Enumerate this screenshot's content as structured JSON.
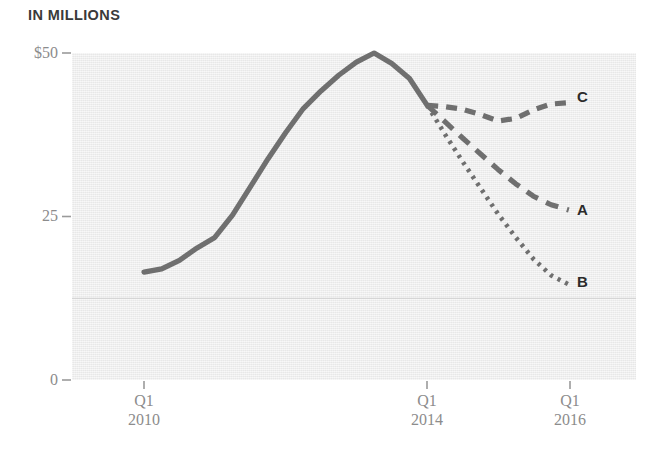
{
  "chart_data": {
    "type": "line",
    "title": "IN MILLIONS",
    "xlabel": "",
    "ylabel": "",
    "ylim": [
      0,
      50
    ],
    "yticks": [
      0,
      25,
      50
    ],
    "ytick_labels": [
      "0",
      "25",
      "$50"
    ],
    "xtick_labels": [
      {
        "quarter": "Q1",
        "year": "2010"
      },
      {
        "quarter": "Q1",
        "year": "2014"
      },
      {
        "quarter": "Q1",
        "year": "2016"
      }
    ],
    "grid": "single faint horizontal rule at 12.5",
    "gridline_values": [
      12.5
    ],
    "legend_position": "inline-right-of-line-ends",
    "line_color": "#6e6e6e",
    "plot_background": "#ececec",
    "series": [
      {
        "name": "history",
        "label": "",
        "style": "solid",
        "x": [
          "Q1 2010",
          "Q2 2010",
          "Q3 2010",
          "Q4 2010",
          "Q1 2011",
          "Q2 2011",
          "Q3 2011",
          "Q4 2011",
          "Q1 2012",
          "Q2 2012",
          "Q3 2012",
          "Q4 2012",
          "Q1 2013",
          "Q2 2013",
          "Q3 2013",
          "Q4 2013",
          "Q1 2014"
        ],
        "values": [
          16.5,
          17.0,
          18.3,
          20.2,
          21.8,
          25.2,
          29.5,
          33.8,
          37.8,
          41.5,
          44.2,
          46.6,
          48.6,
          50.0,
          48.4,
          46.1,
          42.0
        ]
      },
      {
        "name": "scenario-c",
        "label": "C",
        "style": "dashed",
        "x": [
          "Q1 2014",
          "Q2 2014",
          "Q3 2014",
          "Q4 2014",
          "Q1 2015",
          "Q2 2015",
          "Q3 2015",
          "Q4 2015",
          "Q1 2016"
        ],
        "values": [
          42.0,
          41.8,
          41.4,
          40.6,
          39.6,
          40.0,
          41.3,
          42.2,
          42.4
        ]
      },
      {
        "name": "scenario-a",
        "label": "A",
        "style": "dashed-medium",
        "x": [
          "Q1 2014",
          "Q2 2014",
          "Q3 2014",
          "Q4 2014",
          "Q1 2015",
          "Q2 2015",
          "Q3 2015",
          "Q4 2015",
          "Q1 2016"
        ],
        "values": [
          42.0,
          39.5,
          37.0,
          34.6,
          32.2,
          30.0,
          28.1,
          26.8,
          26.0
        ]
      },
      {
        "name": "scenario-b",
        "label": "B",
        "style": "dotted",
        "x": [
          "Q1 2014",
          "Q2 2014",
          "Q3 2014",
          "Q4 2014",
          "Q1 2015",
          "Q2 2015",
          "Q3 2015",
          "Q4 2015",
          "Q1 2016"
        ],
        "values": [
          42.0,
          37.6,
          33.4,
          29.4,
          25.4,
          21.8,
          18.5,
          16.0,
          14.6
        ]
      }
    ]
  },
  "axis": {
    "y_tick_0": "0",
    "y_tick_25": "25",
    "y_tick_50": "$50",
    "x_tick_1_quarter": "Q1",
    "x_tick_1_year": "2010",
    "x_tick_2_quarter": "Q1",
    "x_tick_2_year": "2014",
    "x_tick_3_quarter": "Q1",
    "x_tick_3_year": "2016"
  },
  "labels": {
    "series_a": "A",
    "series_b": "B",
    "series_c": "C"
  }
}
